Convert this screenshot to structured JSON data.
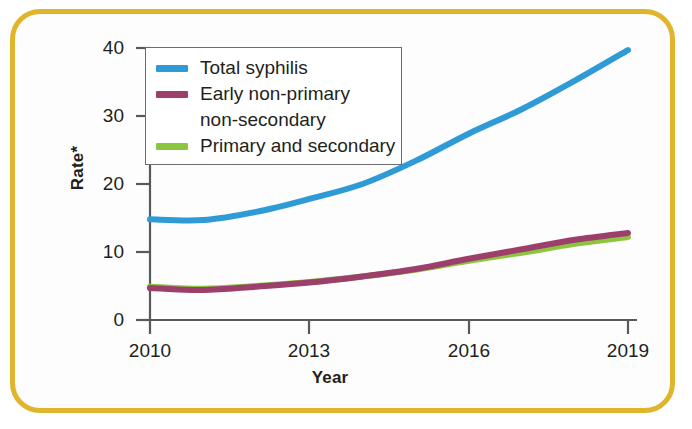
{
  "frame": {
    "border_color": "#e0b52c",
    "background": "#fdfdfd"
  },
  "legend": {
    "entries": [
      {
        "label": "Total syphilis",
        "color": "#2e9bd6",
        "continuation": ""
      },
      {
        "label": "Early non-primary",
        "color": "#9c3f6b",
        "continuation": "non-secondary"
      },
      {
        "label": "Primary and secondary",
        "color": "#8cc63e",
        "continuation": ""
      }
    ]
  },
  "axes": {
    "ylabel": "Rate*",
    "xlabel": "Year",
    "yticks": [
      "0",
      "10",
      "20",
      "30",
      "40"
    ],
    "xticks": [
      "2010",
      "2013",
      "2016",
      "2019"
    ]
  },
  "chart_data": {
    "type": "line",
    "title": "",
    "xlabel": "Year",
    "ylabel": "Rate*",
    "xlim": [
      2010,
      2019
    ],
    "ylim": [
      0,
      40
    ],
    "xticks": [
      2010,
      2013,
      2016,
      2019
    ],
    "yticks": [
      0,
      10,
      20,
      30,
      40
    ],
    "grid": false,
    "legend_position": "upper-left",
    "x": [
      2010,
      2011,
      2012,
      2013,
      2014,
      2015,
      2016,
      2017,
      2018,
      2019
    ],
    "series": [
      {
        "name": "Total syphilis",
        "color": "#2e9bd6",
        "values": [
          14.8,
          14.7,
          15.9,
          17.8,
          20.0,
          23.4,
          27.4,
          31.0,
          35.2,
          39.7
        ]
      },
      {
        "name": "Early non-primary non-secondary",
        "color": "#9c3f6b",
        "values": [
          4.7,
          4.4,
          4.9,
          5.5,
          6.4,
          7.5,
          9.0,
          10.4,
          11.8,
          12.8
        ]
      },
      {
        "name": "Primary and secondary",
        "color": "#8cc63e",
        "values": [
          4.9,
          4.6,
          5.0,
          5.6,
          6.4,
          7.4,
          8.7,
          9.9,
          11.2,
          12.2
        ]
      }
    ]
  }
}
